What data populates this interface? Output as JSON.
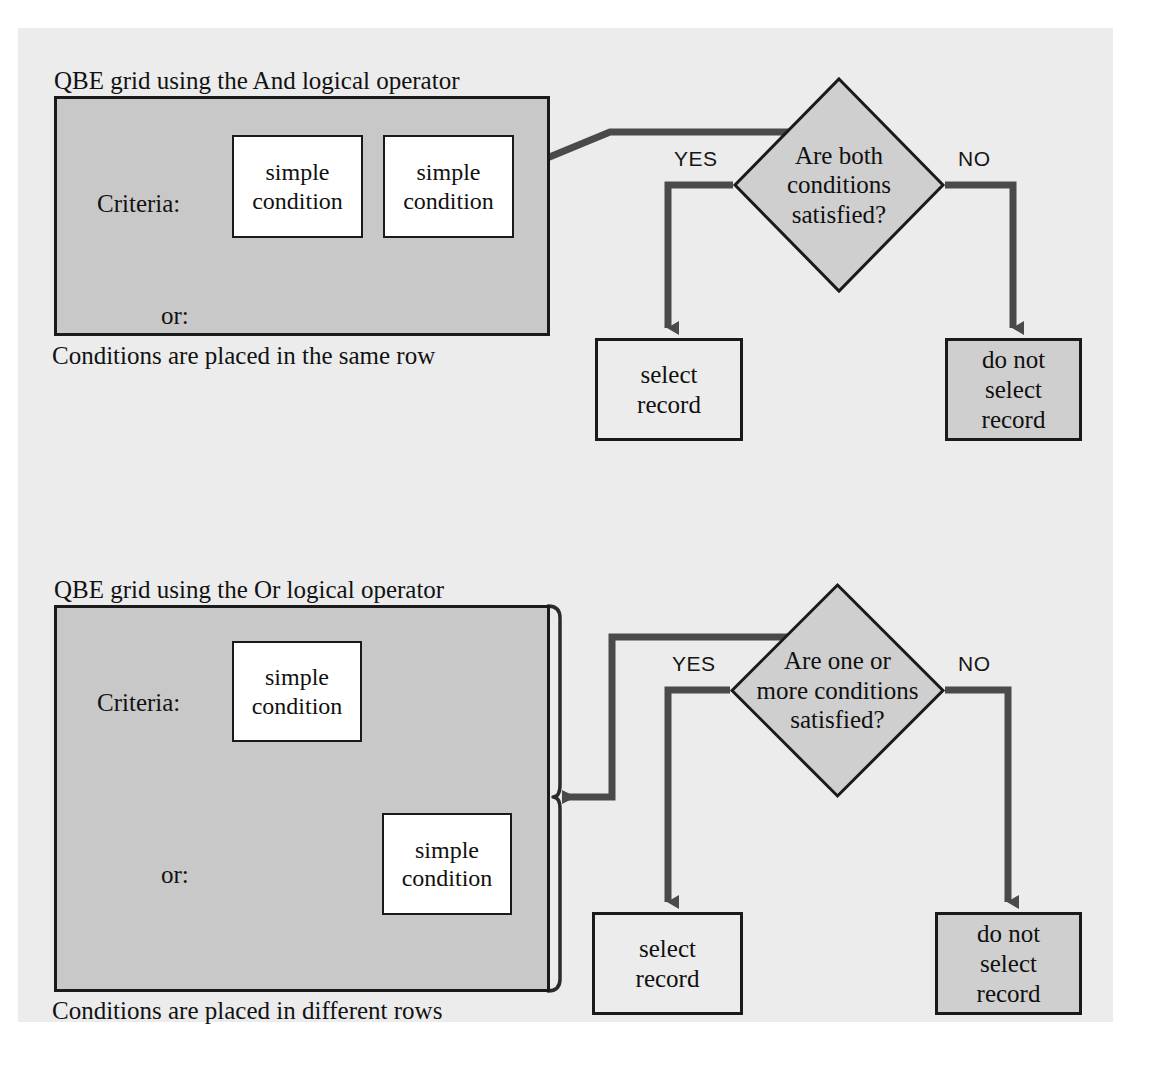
{
  "page": {
    "background_color": "#ffffff",
    "canvas_color": "#ececed",
    "line_color": "#4a4a4a",
    "ink_color": "#121212",
    "grid_fill": "#c8c8c8",
    "diamond_fill": "#cfcfcf",
    "shaded_box_fill": "#cfcfcf",
    "light_box_fill": "#ececec"
  },
  "sections": [
    {
      "id": "and-section",
      "title": "QBE grid using the And logical operator",
      "caption": "Conditions are placed in the same row",
      "grid": {
        "row_labels": [
          "Criteria:",
          "or:"
        ],
        "conditions": [
          {
            "line1": "simple",
            "line2": "condition"
          },
          {
            "line1": "simple",
            "line2": "condition"
          }
        ]
      },
      "decision": {
        "line1": "Are both",
        "line2": "conditions",
        "line3": "satisfied?"
      },
      "yes_label": "YES",
      "no_label": "NO",
      "yes_outcome": {
        "line1": "select",
        "line2": "record"
      },
      "no_outcome": {
        "line1": "do not",
        "line2": "select",
        "line3": "record"
      }
    },
    {
      "id": "or-section",
      "title": "QBE grid using the Or logical operator",
      "caption": "Conditions are placed in different rows",
      "grid": {
        "row_labels": [
          "Criteria:",
          "or:"
        ],
        "conditions": [
          {
            "line1": "simple",
            "line2": "condition"
          },
          {
            "line1": "simple",
            "line2": "condition"
          }
        ]
      },
      "decision": {
        "line1": "Are one or",
        "line2": "more conditions",
        "line3": "satisfied?"
      },
      "yes_label": "YES",
      "no_label": "NO",
      "yes_outcome": {
        "line1": "select",
        "line2": "record"
      },
      "no_outcome": {
        "line1": "do not",
        "line2": "select",
        "line3": "record"
      }
    }
  ]
}
